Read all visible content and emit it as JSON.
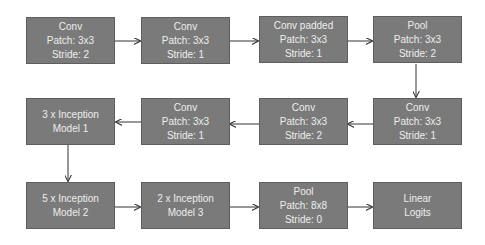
{
  "diagram": {
    "nodes": [
      {
        "id": "n1",
        "lines": [
          "Conv",
          "Patch: 3x3",
          "Stride: 2"
        ]
      },
      {
        "id": "n2",
        "lines": [
          "Conv",
          "Patch: 3x3",
          "Stride: 1"
        ]
      },
      {
        "id": "n3",
        "lines": [
          "Conv padded",
          "Patch: 3x3",
          "Stride: 1"
        ]
      },
      {
        "id": "n4",
        "lines": [
          "Pool",
          "Patch: 3x3",
          "Stride: 2"
        ]
      },
      {
        "id": "n5",
        "lines": [
          "Conv",
          "Patch: 3x3",
          "Stride: 1"
        ]
      },
      {
        "id": "n6",
        "lines": [
          "Conv",
          "Patch: 3x3",
          "Stride: 2"
        ]
      },
      {
        "id": "n7",
        "lines": [
          "Conv",
          "Patch: 3x3",
          "Stride: 1"
        ]
      },
      {
        "id": "n8",
        "lines": [
          "3 x Inception",
          "Model 1"
        ]
      },
      {
        "id": "n9",
        "lines": [
          "5 x Inception",
          "Model 2"
        ]
      },
      {
        "id": "n10",
        "lines": [
          "2 x Inception",
          "Model 3"
        ]
      },
      {
        "id": "n11",
        "lines": [
          "Pool",
          "Patch: 8x8",
          "Stride: 0"
        ]
      },
      {
        "id": "n12",
        "lines": [
          "Linear",
          "Logits"
        ]
      }
    ],
    "edges": [
      [
        "n1",
        "n2"
      ],
      [
        "n2",
        "n3"
      ],
      [
        "n3",
        "n4"
      ],
      [
        "n4",
        "n5"
      ],
      [
        "n5",
        "n6"
      ],
      [
        "n6",
        "n7"
      ],
      [
        "n7",
        "n8"
      ],
      [
        "n8",
        "n9"
      ],
      [
        "n9",
        "n10"
      ],
      [
        "n10",
        "n11"
      ],
      [
        "n11",
        "n12"
      ]
    ],
    "colors": {
      "box_fill": "#7a7a7a",
      "box_text": "#eeeeee",
      "arrow": "#333333"
    }
  }
}
